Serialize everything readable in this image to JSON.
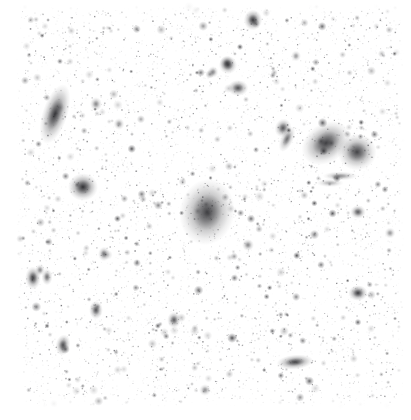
{
  "view": {
    "kind": "astronomical-image-cutout",
    "title": "Sky Survey Cutout",
    "width": 411,
    "height": 420,
    "colormap": "inverted-grayscale",
    "background_color": "#ffffff",
    "source_color": "#1a1a1a",
    "margin_left": 16,
    "margin_bottom": 14,
    "margin_right": 8,
    "margin_top": 6
  },
  "noise": {
    "seed": 20240517,
    "speckle_count": 5200,
    "speckle_min_alpha": 0.04,
    "speckle_max_alpha": 0.55,
    "speckle_min_radius": 0.4,
    "speckle_max_radius": 1.5,
    "faint_source_count": 430,
    "faint_source_min_radius": 0.9,
    "faint_source_max_radius": 2.4,
    "faint_source_min_alpha": 0.18,
    "faint_source_max_alpha": 0.78
  },
  "galaxies": [
    {
      "name": "edge-on-spiral-upper-left",
      "x": 55,
      "y": 114,
      "rx": 5.5,
      "ry": 13.5,
      "angle": 18,
      "peak": 0.86,
      "type": "edge-on"
    },
    {
      "name": "compact-source-left-mid",
      "x": 83,
      "y": 187,
      "rx": 6.5,
      "ry": 6.0,
      "angle": 0,
      "peak": 0.88,
      "type": "compact"
    },
    {
      "name": "central-diffuse-elliptical",
      "x": 207,
      "y": 212,
      "rx": 12.0,
      "ry": 14.5,
      "angle": 10,
      "peak": 0.8,
      "type": "elliptical"
    },
    {
      "name": "bright-spiral-upper-right",
      "x": 326,
      "y": 143,
      "rx": 11.5,
      "ry": 8.5,
      "angle": -35,
      "peak": 0.82,
      "type": "spiral"
    },
    {
      "name": "bright-elliptical-right",
      "x": 357,
      "y": 152,
      "rx": 8.5,
      "ry": 8.0,
      "angle": 0,
      "peak": 0.8,
      "type": "elliptical"
    },
    {
      "name": "compact-source-top-centre",
      "x": 253,
      "y": 20,
      "rx": 4.0,
      "ry": 4.5,
      "angle": 0,
      "peak": 0.85,
      "type": "compact"
    },
    {
      "name": "compact-source-upper-centre",
      "x": 228,
      "y": 65,
      "rx": 4.0,
      "ry": 4.0,
      "angle": 0,
      "peak": 0.7,
      "type": "compact"
    },
    {
      "name": "compact-source-upper-centre-lower",
      "x": 238,
      "y": 88,
      "rx": 4.5,
      "ry": 3.5,
      "angle": 0,
      "peak": 0.74,
      "type": "compact"
    },
    {
      "name": "compact-source-upper-right-a",
      "x": 227,
      "y": 63,
      "rx": 3.2,
      "ry": 3.2,
      "angle": 0,
      "peak": 0.62,
      "type": "compact"
    },
    {
      "name": "small-source-right-upper",
      "x": 283,
      "y": 128,
      "rx": 3.6,
      "ry": 4.2,
      "angle": 20,
      "peak": 0.72,
      "type": "compact"
    },
    {
      "name": "elongated-source-right-upper",
      "x": 287,
      "y": 139,
      "rx": 2.8,
      "ry": 6.0,
      "angle": 25,
      "peak": 0.62,
      "type": "edge-on"
    },
    {
      "name": "faint-streak-right",
      "x": 340,
      "y": 176,
      "rx": 7.5,
      "ry": 2.0,
      "angle": 0,
      "peak": 0.48,
      "type": "streak"
    },
    {
      "name": "faint-streak-right-lower",
      "x": 330,
      "y": 183,
      "rx": 6.0,
      "ry": 1.8,
      "angle": 0,
      "peak": 0.34,
      "type": "streak"
    },
    {
      "name": "compact-source-right-mid",
      "x": 358,
      "y": 212,
      "rx": 3.4,
      "ry": 3.0,
      "angle": 0,
      "peak": 0.7,
      "type": "compact"
    },
    {
      "name": "compact-source-right-lower",
      "x": 358,
      "y": 293,
      "rx": 4.2,
      "ry": 3.4,
      "angle": 0,
      "peak": 0.84,
      "type": "compact"
    },
    {
      "name": "edge-on-galaxy-bottom-right",
      "x": 295,
      "y": 362,
      "rx": 8.0,
      "ry": 3.2,
      "angle": -5,
      "peak": 0.8,
      "type": "edge-on"
    },
    {
      "name": "compact-source-lower-left",
      "x": 33,
      "y": 278,
      "rx": 3.4,
      "ry": 5.0,
      "angle": 0,
      "peak": 0.82,
      "type": "edge-on"
    },
    {
      "name": "compact-source-lower-left-b",
      "x": 47,
      "y": 277,
      "rx": 2.4,
      "ry": 3.6,
      "angle": 0,
      "peak": 0.62,
      "type": "compact"
    },
    {
      "name": "compact-source-lower-centre",
      "x": 63,
      "y": 345,
      "rx": 3.2,
      "ry": 4.6,
      "angle": 10,
      "peak": 0.76,
      "type": "compact"
    },
    {
      "name": "compact-source-lower-centre-b",
      "x": 174,
      "y": 320,
      "rx": 3.0,
      "ry": 3.6,
      "angle": 0,
      "peak": 0.7,
      "type": "compact"
    },
    {
      "name": "compact-source-mid-left",
      "x": 96,
      "y": 310,
      "rx": 3.0,
      "ry": 4.0,
      "angle": 0,
      "peak": 0.74,
      "type": "compact"
    },
    {
      "name": "compact-source-centre-low",
      "x": 104,
      "y": 254,
      "rx": 2.6,
      "ry": 3.2,
      "angle": 0,
      "peak": 0.6,
      "type": "compact"
    },
    {
      "name": "compact-source-top-left-faint",
      "x": 96,
      "y": 104,
      "rx": 2.6,
      "ry": 3.0,
      "angle": 0,
      "peak": 0.52,
      "type": "compact"
    },
    {
      "name": "compact-source-top-centre-faint",
      "x": 119,
      "y": 124,
      "rx": 2.4,
      "ry": 2.6,
      "angle": 0,
      "peak": 0.46,
      "type": "compact"
    },
    {
      "name": "compact-source-upper-mid",
      "x": 213,
      "y": 72,
      "rx": 2.4,
      "ry": 2.6,
      "angle": 0,
      "peak": 0.5,
      "type": "compact"
    },
    {
      "name": "compact-source-left-edge",
      "x": 40,
      "y": 270,
      "rx": 2.2,
      "ry": 2.6,
      "angle": 0,
      "peak": 0.5,
      "type": "compact"
    },
    {
      "name": "compact-source-centre-right",
      "x": 248,
      "y": 245,
      "rx": 2.6,
      "ry": 2.6,
      "angle": 0,
      "peak": 0.52,
      "type": "compact"
    },
    {
      "name": "compact-source-bottom-mid",
      "x": 205,
      "y": 390,
      "rx": 2.6,
      "ry": 2.6,
      "angle": 0,
      "peak": 0.48,
      "type": "compact"
    },
    {
      "name": "compact-source-top-right-faint",
      "x": 296,
      "y": 56,
      "rx": 2.2,
      "ry": 2.4,
      "angle": 0,
      "peak": 0.44,
      "type": "compact"
    },
    {
      "name": "compact-source-right-edge",
      "x": 390,
      "y": 233,
      "rx": 2.4,
      "ry": 2.4,
      "angle": 0,
      "peak": 0.46,
      "type": "compact"
    }
  ]
}
